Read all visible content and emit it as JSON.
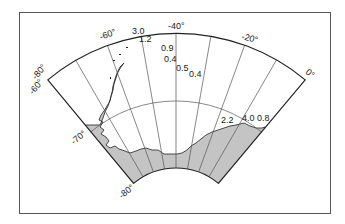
{
  "map": {
    "title": "",
    "projection": "polar sector",
    "longitude_range": [
      -80,
      0
    ],
    "latitude_range": [
      -80,
      -60
    ],
    "land_color": "#c4c4c4",
    "line_color": "#222222",
    "grid_color": "#555555",
    "longitude_labels": [
      {
        "text": "-80°",
        "lon": -80
      },
      {
        "text": "-60°",
        "lon": -60
      },
      {
        "text": "-40°",
        "lon": -40
      },
      {
        "text": "-20°",
        "lon": -20
      },
      {
        "text": "0°",
        "lon": 0
      }
    ],
    "latitude_labels": [
      {
        "text": "-60°",
        "lat": -60
      },
      {
        "text": "-70°",
        "lat": -70
      },
      {
        "text": "-80°",
        "lat": -80
      }
    ],
    "values": [
      {
        "text": "3.0",
        "x": 132,
        "y": 34
      },
      {
        "text": "1.2",
        "x": 139,
        "y": 42
      },
      {
        "text": "0.9",
        "x": 161,
        "y": 51
      },
      {
        "text": "0.4",
        "x": 164,
        "y": 62
      },
      {
        "text": "0.5",
        "x": 176,
        "y": 71
      },
      {
        "text": "0.4",
        "x": 189,
        "y": 77
      },
      {
        "text": "2.2",
        "x": 221,
        "y": 123
      },
      {
        "text": "4.0",
        "x": 242,
        "y": 121
      },
      {
        "text": "0.8",
        "x": 257,
        "y": 121
      }
    ]
  }
}
